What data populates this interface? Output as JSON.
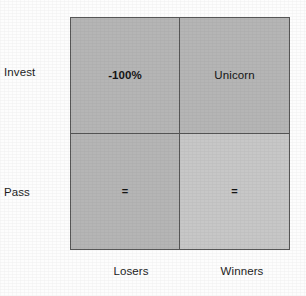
{
  "figure": {
    "name": "invest-pass-decision-matrix",
    "colors": {
      "cell_fill": "#b5b5b5",
      "cell_fill_light": "#c7c7c7",
      "border": "#565656",
      "text": "#141414",
      "background": "#fdfdfd"
    }
  },
  "axes": {
    "rows": {
      "label_position": "left",
      "items": [
        {
          "key": "invest",
          "label": "Invest"
        },
        {
          "key": "pass",
          "label": "Pass"
        }
      ]
    },
    "columns": {
      "label_position": "bottom",
      "items": [
        {
          "key": "losers",
          "label": "Losers"
        },
        {
          "key": "winners",
          "label": "Winners"
        }
      ]
    }
  },
  "grid": {
    "cells": [
      {
        "key": "invest-losers",
        "row": "Invest",
        "column": "Losers",
        "text": "-100%",
        "fill": "#b5b5b5"
      },
      {
        "key": "invest-winners",
        "row": "Invest",
        "column": "Winners",
        "text": "Unicorn",
        "fill": "#b5b5b5"
      },
      {
        "key": "pass-losers",
        "row": "Pass",
        "column": "Losers",
        "text": "=",
        "fill": "#b5b5b5"
      },
      {
        "key": "pass-winners",
        "row": "Pass",
        "column": "Winners",
        "text": "=",
        "fill": "#c7c7c7"
      }
    ]
  }
}
